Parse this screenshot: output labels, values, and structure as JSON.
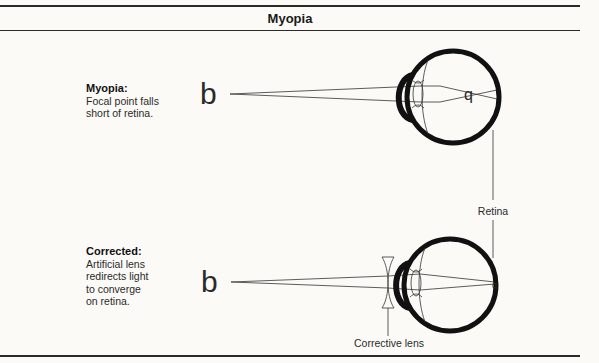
{
  "title": "Myopia",
  "panels": [
    {
      "id": "myopia",
      "heading": "Myopia:",
      "description_lines": [
        "Focal point falls",
        "short of retina."
      ],
      "object_label": "b",
      "image_label": "q"
    },
    {
      "id": "corrected",
      "heading": "Corrected:",
      "description_lines": [
        "Artificial lens",
        "redirects light",
        "to converge",
        "on retina."
      ],
      "object_label": "b",
      "image_label": "q"
    }
  ],
  "labels": {
    "retina": "Retina",
    "corrective_lens": "Corrective lens"
  },
  "colors": {
    "background": "#fbfaf6",
    "ink": "#1a1a1a",
    "rule": "#2a2a2a"
  }
}
